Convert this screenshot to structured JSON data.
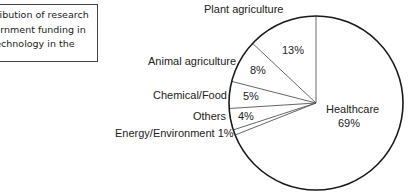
{
  "caption": {
    "lines": [
      "Distribution of research",
      "government funding in",
      "biotechnology in the",
      ""
    ]
  },
  "chart_data": {
    "type": "pie",
    "title": "",
    "start_angle_deg": 0,
    "direction": "counterclockwise",
    "slices": [
      {
        "label": "Plant agriculture",
        "value": 13,
        "value_label": "13%"
      },
      {
        "label": "Animal agriculture",
        "value": 8,
        "value_label": "8%"
      },
      {
        "label": "Chemical/Food",
        "value": 5,
        "value_label": "5%"
      },
      {
        "label": "Others",
        "value": 4,
        "value_label": "4%"
      },
      {
        "label": "Energy/Environment",
        "value": 1,
        "value_label": "1%"
      },
      {
        "label": "Healthcare",
        "value": 69,
        "value_label": "69%"
      }
    ]
  },
  "labels": {
    "plant": "Plant agriculture",
    "animal": "Animal agriculture",
    "chemical": "Chemical/Food",
    "others": "Others",
    "energy": "Energy/Environment 1%",
    "healthcare": "Healthcare",
    "pct_plant": "13%",
    "pct_animal": "8%",
    "pct_chemical": "5%",
    "pct_others": "4%",
    "pct_healthcare": "69%"
  }
}
